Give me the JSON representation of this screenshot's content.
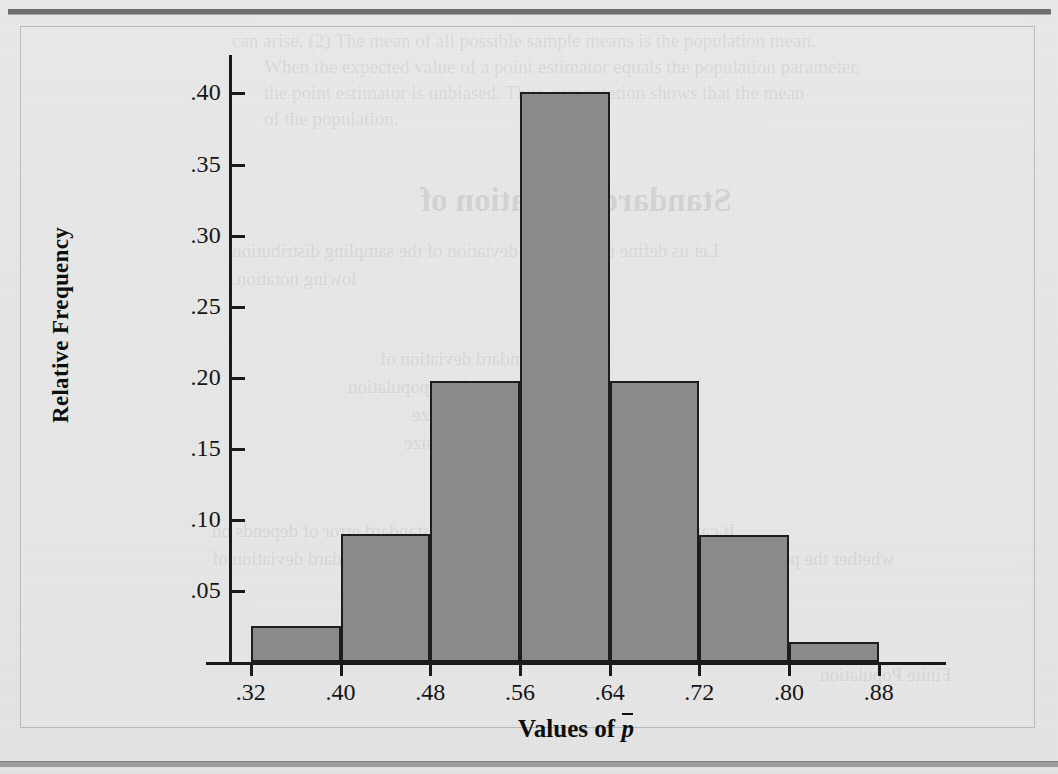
{
  "figure": {
    "y_axis_title": "Relative Frequency",
    "x_axis_title_prefix": "Values of ",
    "x_axis_variable": "p"
  },
  "chart_data": {
    "type": "bar",
    "title": "",
    "subtitle": "",
    "xlabel": "Values of p̄",
    "ylabel": "Relative Frequency",
    "grid": false,
    "legend": "none",
    "bin_edges": [
      0.32,
      0.4,
      0.48,
      0.56,
      0.64,
      0.72,
      0.8,
      0.88
    ],
    "bin_width": 0.08,
    "categories": [
      ".32-.40",
      ".40-.48",
      ".48-.56",
      ".56-.64",
      ".64-.72",
      ".72-.80",
      ".80-.88"
    ],
    "values": [
      0.025,
      0.09,
      0.198,
      0.401,
      0.198,
      0.089,
      0.014
    ],
    "xlim": [
      0.28,
      0.94
    ],
    "ylim": [
      0.0,
      0.42
    ],
    "xticks": [
      ".32",
      ".40",
      ".48",
      ".56",
      ".64",
      ".72",
      ".80",
      ".88"
    ],
    "xtick_values": [
      0.32,
      0.4,
      0.48,
      0.56,
      0.64,
      0.72,
      0.8,
      0.88
    ],
    "yticks": [
      ".05",
      ".10",
      ".15",
      ".20",
      ".25",
      ".30",
      ".35",
      ".40"
    ],
    "ytick_values": [
      0.05,
      0.1,
      0.15,
      0.2,
      0.25,
      0.3,
      0.35,
      0.4
    ],
    "bar_fill_color": "#8a8a8a",
    "bar_edge_color": "#1d1d1d",
    "axis_color": "#1b1b1b",
    "background_color": "#e7e7e7"
  },
  "ghost_text": {
    "lines": [
      {
        "text": "can arise. (2) The mean of all possible sample means is the population mean.",
        "left": 232,
        "top": 30,
        "size": 19,
        "bold": false,
        "mirror": false
      },
      {
        "text": "When the expected value of a point estimator equals the population parameter,",
        "left": 264,
        "top": 56,
        "size": 19,
        "bold": false,
        "mirror": false
      },
      {
        "text": "the point estimator is unbiased. Thus, our notation shows that the mean",
        "left": 264,
        "top": 82,
        "size": 19,
        "bold": false,
        "mirror": false
      },
      {
        "text": "of the population.",
        "left": 264,
        "top": 108,
        "size": 19,
        "bold": false,
        "mirror": false
      },
      {
        "text": "Standard Deviation of",
        "left": 420,
        "top": 182,
        "size": 33,
        "bold": true,
        "mirror": true
      },
      {
        "text": "Let us define the standard deviation of the sampling distribution",
        "left": 232,
        "top": 240,
        "size": 19,
        "bold": false,
        "mirror": true
      },
      {
        "text": "lowing notation.",
        "left": 232,
        "top": 268,
        "size": 19,
        "bold": false,
        "mirror": true
      },
      {
        "text": "the standard deviation of",
        "left": 380,
        "top": 348,
        "size": 19,
        "bold": false,
        "mirror": true
      },
      {
        "text": "the standard deviation of the population",
        "left": 348,
        "top": 376,
        "size": 19,
        "bold": false,
        "mirror": true
      },
      {
        "text": "the sample size",
        "left": 412,
        "top": 404,
        "size": 19,
        "bold": false,
        "mirror": true
      },
      {
        "text": "the population size",
        "left": 404,
        "top": 432,
        "size": 19,
        "bold": false,
        "mirror": true
      },
      {
        "text": "It can be shown that the formula for the standard error of depends on",
        "left": 212,
        "top": 520,
        "size": 19,
        "bold": false,
        "mirror": true
      },
      {
        "text": "whether the population is finite or infinite. The two formulas for the standard deviation of",
        "left": 212,
        "top": 548,
        "size": 19,
        "bold": false,
        "mirror": true
      },
      {
        "text": "Finite Population",
        "left": 820,
        "top": 664,
        "size": 19,
        "bold": false,
        "mirror": true
      }
    ]
  }
}
